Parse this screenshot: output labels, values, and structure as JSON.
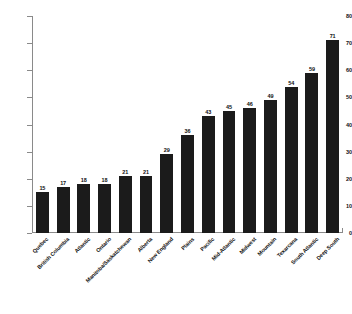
{
  "chart_data": {
    "type": "bar",
    "title": "",
    "subtitle": "",
    "xlabel": "",
    "ylabel": "",
    "ylim": [
      0,
      80
    ],
    "yticks": [
      0,
      10,
      20,
      30,
      40,
      50,
      60,
      70,
      80
    ],
    "grid": false,
    "legend": false,
    "bar_color": "#1b1b1b",
    "axis_color": "#8a8a8a",
    "background": "#ffffff",
    "value_labels_shown": true,
    "categories": [
      "Quebec",
      "British Columbia",
      "Atlantic",
      "Ontario",
      "Manitoba/Saskatchewan",
      "Alberta",
      "New England",
      "Plains",
      "Pacific",
      "Mid-Atlantic",
      "Midwest",
      "Mountain",
      "Texarcana",
      "South Atlantic",
      "Deep South"
    ],
    "values": [
      15,
      17,
      18,
      18,
      21,
      21,
      29,
      36,
      43,
      45,
      46,
      49,
      54,
      59,
      71
    ]
  }
}
